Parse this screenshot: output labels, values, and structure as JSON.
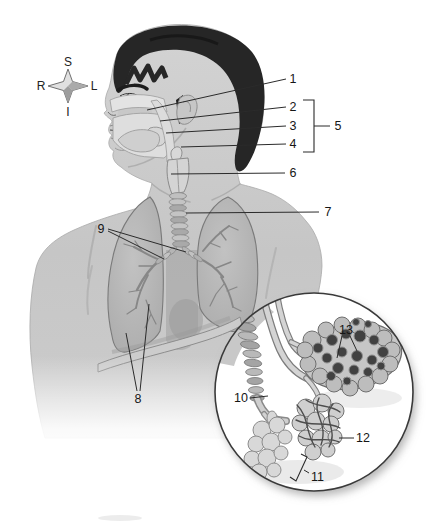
{
  "diagram": {
    "compass": {
      "top": "S",
      "left": "R",
      "right": "L",
      "bottom": "I"
    },
    "callouts": {
      "c1": "1",
      "c2": "2",
      "c3": "3",
      "c4": "4",
      "c5": "5",
      "c6": "6",
      "c7": "7",
      "c8": "8",
      "c9": "9",
      "c10": "10",
      "c11": "11",
      "c12": "12",
      "c13": "13"
    },
    "colors": {
      "background": "#ffffff",
      "line_art": "#2b2b2b",
      "skin": "#c9c9c9",
      "hair": "#262626",
      "lung": "#b3b3b3",
      "airway_highlight": "#e2e2e2"
    }
  }
}
